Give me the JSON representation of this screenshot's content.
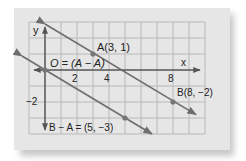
{
  "figure": {
    "axis_labels": {
      "x": "x",
      "y": "y"
    },
    "x_ticks": [
      {
        "value": 2,
        "label": "2"
      },
      {
        "value": 4,
        "label": "4"
      },
      {
        "value": 8,
        "label": "8"
      }
    ],
    "y_ticks": [
      {
        "value": -2,
        "label": "−2"
      }
    ],
    "points": [
      {
        "name": "A",
        "label": "A(3, 1)",
        "x": 3,
        "y": 1
      },
      {
        "name": "B",
        "label": "B(8, −2)",
        "x": 8,
        "y": -2
      },
      {
        "name": "O",
        "label": "O = (A − A)",
        "x": 0,
        "y": 0
      },
      {
        "name": "B-A",
        "label": "B − A = (5, −3)",
        "x": 5,
        "y": -3
      }
    ],
    "lines": [
      {
        "name": "line-AB",
        "through": [
          "A",
          "B"
        ]
      },
      {
        "name": "line-O-to-B-minus-A",
        "through": [
          "O",
          "B-A"
        ]
      }
    ],
    "colors": {
      "paper": "#e6e6e6",
      "grid": "#b8b8b8",
      "axis": "#555555",
      "line": "#6e6e6e",
      "point": "#777777",
      "text": "#222222"
    }
  }
}
